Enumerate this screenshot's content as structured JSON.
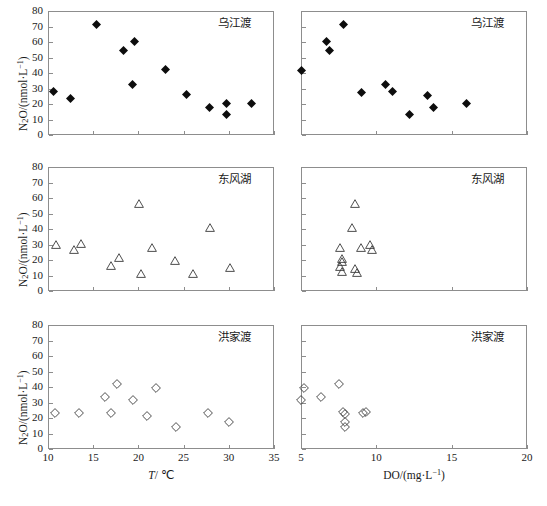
{
  "figure": {
    "caption": "",
    "y_axis_title": "N2O/(nmol·L-1)",
    "x_axis_title_left": "T/ °C",
    "x_axis_title_right": "DO/(mg·L-1)"
  },
  "axes": {
    "y_ticks": [
      "0",
      "10",
      "20",
      "30",
      "40",
      "50",
      "60",
      "70",
      "80"
    ],
    "y_values": [
      0,
      10,
      20,
      30,
      40,
      50,
      60,
      70,
      80
    ],
    "y_range": [
      0,
      80
    ],
    "x_left_ticks": [
      "10",
      "15",
      "20",
      "25",
      "30",
      "35"
    ],
    "x_left_values": [
      10,
      15,
      20,
      25,
      30,
      35
    ],
    "x_left_range": [
      10,
      35
    ],
    "x_right_ticks": [
      "5",
      "10",
      "15",
      "20"
    ],
    "x_right_values": [
      5,
      10,
      15,
      20
    ],
    "x_right_range": [
      5,
      20
    ]
  },
  "panels": [
    {
      "id": "wujiangdu-temp",
      "label": "乌江渡",
      "marker": "filled-diamond",
      "row": 0,
      "col": 0
    },
    {
      "id": "wujiangdu-do",
      "label": "乌江渡",
      "marker": "filled-diamond",
      "row": 0,
      "col": 1
    },
    {
      "id": "dongfenghu-temp",
      "label": "东风湖",
      "marker": "open-triangle",
      "row": 1,
      "col": 0
    },
    {
      "id": "dongfenghu-do",
      "label": "东风湖",
      "marker": "open-triangle",
      "row": 1,
      "col": 1
    },
    {
      "id": "hongjiadu-temp",
      "label": "洪家渡",
      "marker": "open-diamond",
      "row": 2,
      "col": 0
    },
    {
      "id": "hongjiadu-do",
      "label": "洪家渡",
      "marker": "open-diamond",
      "row": 2,
      "col": 1
    }
  ],
  "chart_data": [
    {
      "type": "scatter",
      "panel": "wujiangdu-temp",
      "title": "乌江渡",
      "xlabel": "T/ °C",
      "ylabel": "N2O/(nmol·L-1)",
      "xlim": [
        10,
        35
      ],
      "ylim": [
        0,
        80
      ],
      "marker": "filled-diamond",
      "grid": false,
      "x": [
        10.6,
        12.5,
        15.4,
        18.3,
        19.5,
        19.7,
        23.0,
        27.0,
        29.6,
        30.1,
        32.8
      ],
      "y": [
        31.0,
        27.0,
        74.8,
        57.5,
        63.5,
        35.5,
        45.7,
        29.5,
        21.2,
        23.5,
        16.3,
        23.8
      ],
      "points": [
        {
          "x": 10.6,
          "y": 31.0
        },
        {
          "x": 12.5,
          "y": 27.0
        },
        {
          "x": 15.4,
          "y": 74.8
        },
        {
          "x": 18.3,
          "y": 57.5
        },
        {
          "x": 19.6,
          "y": 63.5
        },
        {
          "x": 19.4,
          "y": 35.5
        },
        {
          "x": 23.0,
          "y": 45.7
        },
        {
          "x": 25.3,
          "y": 29.5
        },
        {
          "x": 27.9,
          "y": 21.2
        },
        {
          "x": 29.7,
          "y": 23.5
        },
        {
          "x": 29.8,
          "y": 16.3
        },
        {
          "x": 32.5,
          "y": 23.8
        }
      ]
    },
    {
      "type": "scatter",
      "panel": "wujiangdu-do",
      "title": "乌江渡",
      "xlabel": "DO/(mg·L-1)",
      "ylabel": "N2O/(nmol·L-1)",
      "xlim": [
        5,
        20
      ],
      "ylim": [
        0,
        80
      ],
      "marker": "filled-diamond",
      "grid": false,
      "points": [
        {
          "x": 5.0,
          "y": 45.0
        },
        {
          "x": 6.7,
          "y": 63.5
        },
        {
          "x": 6.9,
          "y": 57.5
        },
        {
          "x": 7.8,
          "y": 74.8
        },
        {
          "x": 9.0,
          "y": 30.5
        },
        {
          "x": 10.6,
          "y": 35.5
        },
        {
          "x": 11.1,
          "y": 31.0
        },
        {
          "x": 12.2,
          "y": 16.5
        },
        {
          "x": 13.4,
          "y": 29.0
        },
        {
          "x": 13.8,
          "y": 21.0
        },
        {
          "x": 16.0,
          "y": 23.5
        }
      ]
    },
    {
      "type": "scatter",
      "panel": "dongfenghu-temp",
      "title": "东风湖",
      "xlabel": "T/ °C",
      "ylabel": "N2O/(nmol·L-1)",
      "xlim": [
        10,
        35
      ],
      "ylim": [
        0,
        80
      ],
      "marker": "open-triangle",
      "grid": false,
      "points": [
        {
          "x": 10.9,
          "y": 33.0
        },
        {
          "x": 12.9,
          "y": 30.0
        },
        {
          "x": 13.6,
          "y": 33.8
        },
        {
          "x": 17.0,
          "y": 19.5
        },
        {
          "x": 17.8,
          "y": 25.0
        },
        {
          "x": 20.1,
          "y": 59.5
        },
        {
          "x": 20.3,
          "y": 14.8
        },
        {
          "x": 21.5,
          "y": 31.5
        },
        {
          "x": 24.1,
          "y": 23.0
        },
        {
          "x": 26.0,
          "y": 14.6
        },
        {
          "x": 27.9,
          "y": 44.5
        },
        {
          "x": 30.1,
          "y": 18.6
        }
      ]
    },
    {
      "type": "scatter",
      "panel": "dongfenghu-do",
      "title": "东风湖",
      "xlabel": "DO/(mg·L-1)",
      "ylabel": "N2O/(nmol·L-1)",
      "xlim": [
        5,
        20
      ],
      "ylim": [
        0,
        80
      ],
      "marker": "open-triangle",
      "grid": false,
      "points": [
        {
          "x": 7.6,
          "y": 31.5
        },
        {
          "x": 7.7,
          "y": 24.0
        },
        {
          "x": 7.7,
          "y": 22.0
        },
        {
          "x": 7.6,
          "y": 19.0
        },
        {
          "x": 7.7,
          "y": 15.5
        },
        {
          "x": 8.6,
          "y": 59.5
        },
        {
          "x": 8.4,
          "y": 44.5
        },
        {
          "x": 8.6,
          "y": 18.0
        },
        {
          "x": 8.7,
          "y": 15.0
        },
        {
          "x": 9.0,
          "y": 31.0
        },
        {
          "x": 9.6,
          "y": 33.5
        },
        {
          "x": 9.7,
          "y": 30.0
        }
      ]
    },
    {
      "type": "scatter",
      "panel": "hongjiadu-temp",
      "title": "洪家渡",
      "xlabel": "T/ °C",
      "ylabel": "N2O/(nmol·L-1)",
      "xlim": [
        10,
        35
      ],
      "ylim": [
        0,
        80
      ],
      "marker": "open-diamond",
      "grid": false,
      "points": [
        {
          "x": 10.8,
          "y": 26.0
        },
        {
          "x": 13.4,
          "y": 25.5
        },
        {
          "x": 16.3,
          "y": 36.2
        },
        {
          "x": 17.0,
          "y": 25.8
        },
        {
          "x": 17.6,
          "y": 44.5
        },
        {
          "x": 19.4,
          "y": 34.0
        },
        {
          "x": 21.0,
          "y": 24.0
        },
        {
          "x": 21.9,
          "y": 42.2
        },
        {
          "x": 24.2,
          "y": 16.5
        },
        {
          "x": 27.7,
          "y": 25.5
        },
        {
          "x": 30.0,
          "y": 19.8
        }
      ]
    },
    {
      "type": "scatter",
      "panel": "hongjiadu-do",
      "title": "洪家渡",
      "xlabel": "DO/(mg·L-1)",
      "ylabel": "N2O/(nmol·L-1)",
      "xlim": [
        5,
        20
      ],
      "ylim": [
        0,
        80
      ],
      "marker": "open-diamond",
      "grid": false,
      "points": [
        {
          "x": 5.0,
          "y": 34.0
        },
        {
          "x": 5.2,
          "y": 42.0
        },
        {
          "x": 6.3,
          "y": 36.2
        },
        {
          "x": 7.5,
          "y": 44.5
        },
        {
          "x": 7.8,
          "y": 26.2
        },
        {
          "x": 7.9,
          "y": 25.2
        },
        {
          "x": 7.9,
          "y": 19.8
        },
        {
          "x": 7.9,
          "y": 16.5
        },
        {
          "x": 9.1,
          "y": 25.8
        },
        {
          "x": 9.3,
          "y": 26.5
        }
      ]
    }
  ]
}
